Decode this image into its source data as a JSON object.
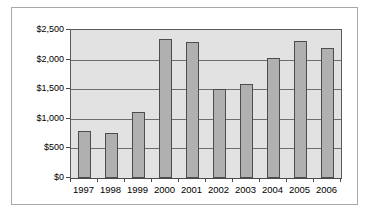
{
  "chart_data": {
    "type": "bar",
    "title": "",
    "subtitle": "",
    "xlabel": "",
    "ylabel": "",
    "categories": [
      "1997",
      "1998",
      "1999",
      "2000",
      "2001",
      "2002",
      "2003",
      "2004",
      "2005",
      "2006"
    ],
    "values": [
      800,
      765,
      1120,
      2350,
      2300,
      1500,
      1580,
      2030,
      2320,
      2200
    ],
    "series": [
      {
        "name": "",
        "values": [
          800,
          765,
          1120,
          2350,
          2300,
          1500,
          1580,
          2030,
          2320,
          2200
        ]
      }
    ],
    "ylim": [
      0,
      2500
    ],
    "ytick_values": [
      0,
      500,
      1000,
      1500,
      2000,
      2500
    ],
    "ytick_labels": [
      "$0",
      "$500",
      "$1,000",
      "$1,500",
      "$2,000",
      "$2,500"
    ],
    "grid": true,
    "grid_axis": "y",
    "legend": false,
    "legend_position": "none",
    "bar_color": "#b0b0b0",
    "bar_border_color": "#4d4d4d",
    "plot_background": "#e2e2e2",
    "gridline_color": "#6e6e6e",
    "axis_color": "#4a4a4a",
    "figure_border_color": "#a8a8a8",
    "figure_background": "#ffffff"
  }
}
